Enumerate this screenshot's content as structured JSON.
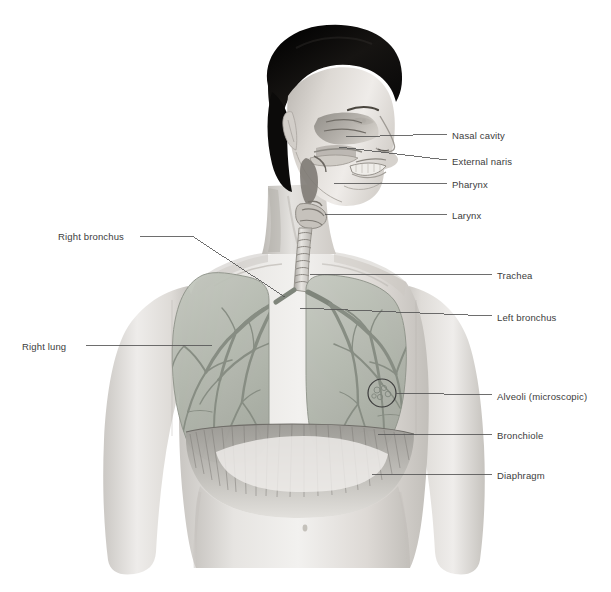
{
  "figure": {
    "background_color": "#ffffff",
    "label_text_color": "#3c3c3c",
    "leader_line_color": "#555555",
    "lung_color": "#b9bdb4",
    "bronchial_tree_color": "#8d938a",
    "skin_color": "#e8e6e3",
    "hair_color": "#14120f"
  },
  "labels": {
    "right_side": [
      {
        "id": "nasal-cavity",
        "text": "Nasal cavity",
        "x": 452,
        "y": 130,
        "line": {
          "x1": 447,
          "y1": 134,
          "x2": 346,
          "y2": 137
        }
      },
      {
        "id": "external-naris",
        "text": "External naris",
        "x": 452,
        "y": 156,
        "line": {
          "x1": 447,
          "y1": 160,
          "x2": 339,
          "y2": 147
        }
      },
      {
        "id": "pharynx",
        "text": "Pharynx",
        "x": 452,
        "y": 179,
        "line": {
          "x1": 447,
          "y1": 183,
          "x2": 334,
          "y2": 183
        }
      },
      {
        "id": "larynx",
        "text": "Larynx",
        "x": 452,
        "y": 210,
        "line": {
          "x1": 447,
          "y1": 214,
          "x2": 325,
          "y2": 214
        }
      },
      {
        "id": "trachea",
        "text": "Trachea",
        "x": 497,
        "y": 270,
        "line": {
          "x1": 492,
          "y1": 274,
          "x2": 310,
          "y2": 274
        }
      },
      {
        "id": "left-bronchus",
        "text": "Left bronchus",
        "x": 497,
        "y": 312,
        "line": {
          "x1": 492,
          "y1": 316,
          "x2": 300,
          "y2": 308
        }
      },
      {
        "id": "alveoli",
        "text": "Alveoli (microscopic)",
        "x": 497,
        "y": 391,
        "line": {
          "x1": 492,
          "y1": 395,
          "x2": 388,
          "y2": 393
        }
      },
      {
        "id": "bronchiole",
        "text": "Bronchiole",
        "x": 497,
        "y": 430,
        "line": {
          "x1": 492,
          "y1": 434,
          "x2": 378,
          "y2": 434
        }
      },
      {
        "id": "diaphragm",
        "text": "Diaphragm",
        "x": 497,
        "y": 470,
        "line": {
          "x1": 492,
          "y1": 474,
          "x2": 372,
          "y2": 474
        }
      }
    ],
    "left_side": [
      {
        "id": "right-bronchus",
        "text": "Right bronchus",
        "x": 58,
        "y": 231,
        "line_points": "140,236 192,236 285,297"
      },
      {
        "id": "right-lung",
        "text": "Right lung",
        "x": 22,
        "y": 341,
        "line_points": "86,345 212,345"
      }
    ]
  },
  "structures": {
    "organs": [
      "nasal cavity",
      "external naris",
      "pharynx",
      "larynx",
      "trachea",
      "right bronchus",
      "left bronchus",
      "right lung",
      "left lung",
      "bronchiole",
      "alveoli",
      "diaphragm"
    ],
    "alveoli_marker": {
      "type": "circle",
      "cx": 382,
      "cy": 393,
      "r": 14
    }
  }
}
